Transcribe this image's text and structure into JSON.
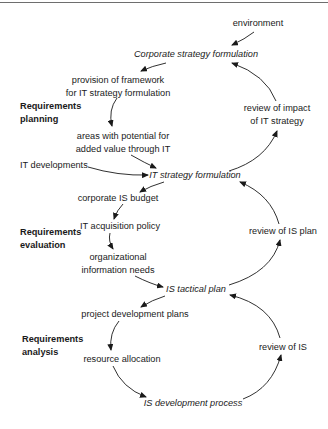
{
  "diagram": {
    "type": "cyclical process flow",
    "phases": [
      {
        "id": "planning",
        "lines": [
          "Requirements",
          "planning"
        ]
      },
      {
        "id": "evaluation",
        "lines": [
          "Requirements",
          "evaluation"
        ]
      },
      {
        "id": "analysis",
        "lines": [
          "Requirements",
          "analysis"
        ]
      }
    ],
    "processes": {
      "corporate": "Corporate strategy formulation",
      "it_strategy": "IT strategy formulation",
      "is_tactical": "IS tactical plan",
      "is_development": "IS development process"
    },
    "inputs": {
      "environment": "environment",
      "it_developments": "IT developments"
    },
    "steps": {
      "provision": [
        "provision of framework",
        "for IT strategy formulation"
      ],
      "areas": [
        "areas with potential for",
        "added value through IT"
      ],
      "budget": "corporate IS budget",
      "acquisition": "IT acquisition policy",
      "org_needs": [
        "organizational",
        "information needs"
      ],
      "project_plans": "project development plans",
      "resource": "resource allocation"
    },
    "reviews": {
      "impact": [
        "review of impact",
        "of IT strategy"
      ],
      "is_plan": "review of IS plan",
      "is": "review of IS"
    },
    "edges": [
      [
        "environment",
        "Corporate strategy formulation"
      ],
      [
        "Corporate strategy formulation",
        "provision of framework for IT strategy formulation"
      ],
      [
        "provision of framework for IT strategy formulation",
        "areas with potential for added value through IT"
      ],
      [
        "areas with potential for added value through IT",
        "IT strategy formulation"
      ],
      [
        "IT developments",
        "IT strategy formulation"
      ],
      [
        "IT strategy formulation",
        "review of impact of IT strategy"
      ],
      [
        "review of impact of IT strategy",
        "Corporate strategy formulation"
      ],
      [
        "IT strategy formulation",
        "corporate IS budget"
      ],
      [
        "corporate IS budget",
        "IT acquisition policy"
      ],
      [
        "IT acquisition policy",
        "organizational information needs"
      ],
      [
        "organizational information needs",
        "IS tactical plan"
      ],
      [
        "IS tactical plan",
        "review of IS plan"
      ],
      [
        "review of IS plan",
        "IT strategy formulation"
      ],
      [
        "IS tactical plan",
        "project development plans"
      ],
      [
        "project development plans",
        "resource allocation"
      ],
      [
        "resource allocation",
        "IS development process"
      ],
      [
        "IS development process",
        "review of IS"
      ],
      [
        "review of IS",
        "IS tactical plan"
      ]
    ]
  }
}
